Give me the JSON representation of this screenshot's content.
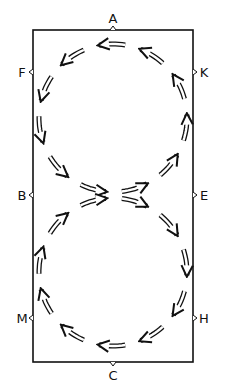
{
  "diagram": {
    "type": "dressage-arena-figure-eight",
    "arena": {
      "x": 33,
      "y": 30,
      "width": 160,
      "height": 332,
      "stroke": "#111111"
    },
    "markers": [
      {
        "letter": "A",
        "x": 113,
        "y": 30,
        "side": "top"
      },
      {
        "letter": "F",
        "x": 33,
        "y": 72,
        "side": "left"
      },
      {
        "letter": "K",
        "x": 193,
        "y": 72,
        "side": "right"
      },
      {
        "letter": "B",
        "x": 33,
        "y": 195,
        "side": "left"
      },
      {
        "letter": "E",
        "x": 193,
        "y": 195,
        "side": "right"
      },
      {
        "letter": "M",
        "x": 33,
        "y": 318,
        "side": "left"
      },
      {
        "letter": "H",
        "x": 193,
        "y": 318,
        "side": "right"
      },
      {
        "letter": "C",
        "x": 113,
        "y": 362,
        "side": "bottom"
      }
    ],
    "circles": [
      {
        "name": "upper-circle",
        "cx": 113,
        "cy": 118,
        "r": 74,
        "direction": "counterclockwise"
      },
      {
        "name": "lower-circle",
        "cx": 113,
        "cy": 272,
        "r": 74,
        "direction": "clockwise"
      }
    ],
    "arrow_stroke": "#111111"
  }
}
